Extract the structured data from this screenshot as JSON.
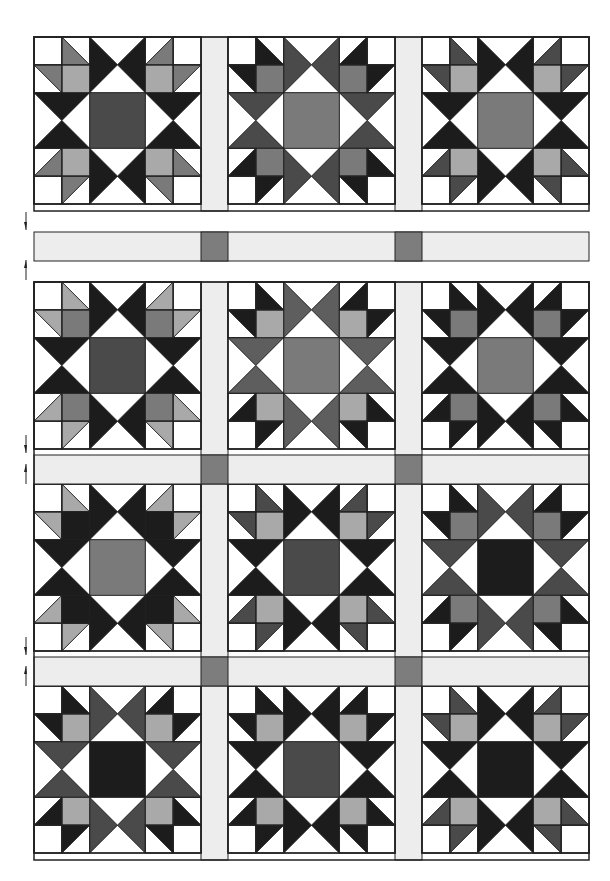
{
  "diagram": {
    "colors": {
      "black": "#1c1c1c",
      "dark": "#4a4a4a",
      "medium": "#7a7a7a",
      "light": "#a9a9a9",
      "white": "#ffffff",
      "sashing": "#ededed",
      "cornerstone": "#7d7d7d",
      "outline": "#222222"
    },
    "layout": {
      "left": 34,
      "block_size": 167,
      "sash_width": 27,
      "columns_x": [
        34,
        228,
        422
      ],
      "sash_columns_x": [
        201,
        395
      ],
      "top_row_y": 37,
      "separated_sash_y": 232,
      "rows_y": [
        282,
        484,
        686
      ],
      "row_sash_y": [
        455,
        657
      ],
      "sash_height": 29
    },
    "arrows": [
      {
        "y": 222,
        "direction": "down"
      },
      {
        "y": 268,
        "direction": "up"
      },
      {
        "y": 445,
        "direction": "down"
      },
      {
        "y": 472,
        "direction": "up"
      },
      {
        "y": 647,
        "direction": "down"
      },
      {
        "y": 674,
        "direction": "up"
      }
    ],
    "blocks": [
      {
        "row": 0,
        "col": 0,
        "center": "dark",
        "points": "black",
        "paw": "medium",
        "paw_square": "light"
      },
      {
        "row": 0,
        "col": 1,
        "center": "medium",
        "points": "dark",
        "paw": "black",
        "paw_square": "medium"
      },
      {
        "row": 0,
        "col": 2,
        "center": "medium",
        "points": "black",
        "paw": "dark",
        "paw_square": "light"
      },
      {
        "row": 1,
        "col": 0,
        "center": "dark",
        "points": "black",
        "paw": "light",
        "paw_square": "medium"
      },
      {
        "row": 1,
        "col": 1,
        "center": "medium",
        "points": "medium_dark",
        "paw": "black",
        "paw_square": "light"
      },
      {
        "row": 1,
        "col": 2,
        "center": "medium",
        "points": "black",
        "paw": "black",
        "paw_square": "medium"
      },
      {
        "row": 2,
        "col": 0,
        "center": "medium",
        "points": "black",
        "paw": "light",
        "paw_square": "black",
        "variant": "solid_star"
      },
      {
        "row": 2,
        "col": 1,
        "center": "dark",
        "points": "black",
        "paw": "dark",
        "paw_square": "light"
      },
      {
        "row": 2,
        "col": 2,
        "center": "black",
        "points": "dark",
        "paw": "black",
        "paw_square": "medium"
      },
      {
        "row": 3,
        "col": 0,
        "center": "black",
        "points": "dark",
        "paw": "black",
        "paw_square": "light"
      },
      {
        "row": 3,
        "col": 1,
        "center": "dark",
        "points": "black",
        "paw": "black",
        "paw_square": "light"
      },
      {
        "row": 3,
        "col": 2,
        "center": "black",
        "points": "black",
        "paw": "dark",
        "paw_square": "light"
      }
    ]
  }
}
